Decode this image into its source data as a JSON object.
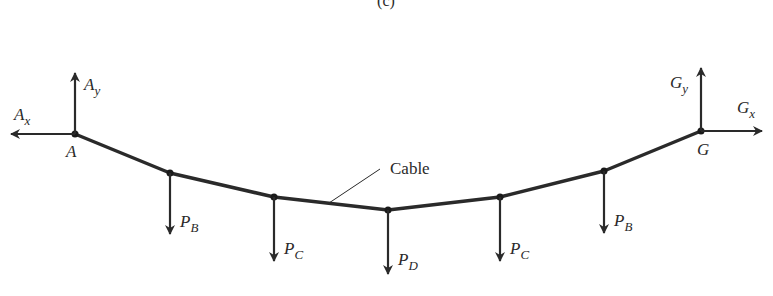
{
  "figure": {
    "caption": "(c)",
    "cable_label": "Cable",
    "colors": {
      "line": "#2a2a2a",
      "background": "#ffffff"
    }
  },
  "supports": [
    {
      "name": "A",
      "label": "A",
      "reactions": [
        {
          "main": "A",
          "sub": "x"
        },
        {
          "main": "A",
          "sub": "y"
        }
      ]
    },
    {
      "name": "G",
      "label": "G",
      "reactions": [
        {
          "main": "G",
          "sub": "x"
        },
        {
          "main": "G",
          "sub": "y"
        }
      ]
    }
  ],
  "loads": [
    {
      "node": "B",
      "main": "P",
      "sub": "B"
    },
    {
      "node": "C",
      "main": "P",
      "sub": "C"
    },
    {
      "node": "D",
      "main": "P",
      "sub": "D"
    },
    {
      "node": "E",
      "main": "P",
      "sub": "C"
    },
    {
      "node": "F",
      "main": "P",
      "sub": "B"
    }
  ]
}
